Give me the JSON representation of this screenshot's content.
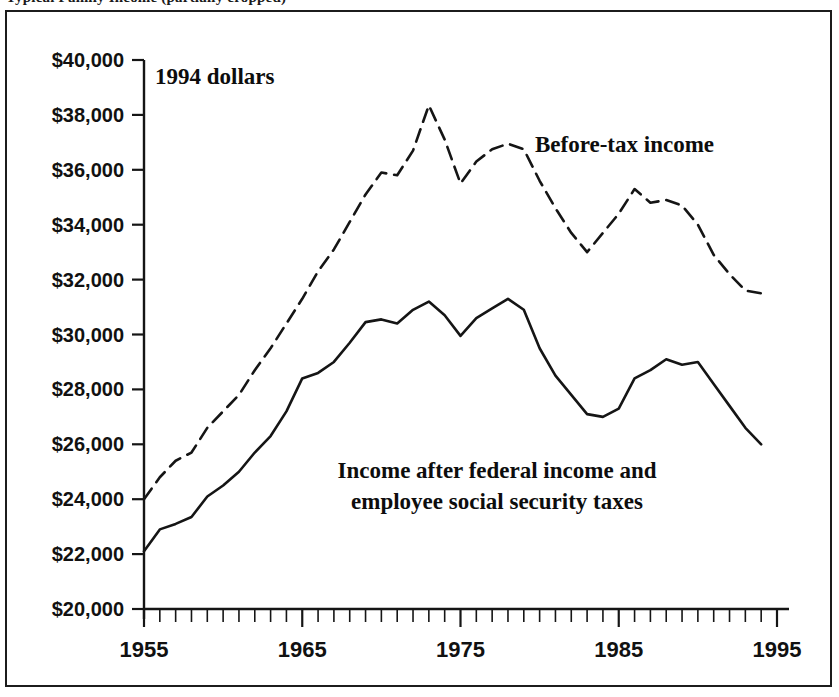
{
  "figure": {
    "title_sliver": "Typical Family Income (partially cropped)",
    "frame_border_color": "#1c1c1c",
    "background_color": "#ffffff"
  },
  "annotations": {
    "units_note": "1994 dollars",
    "before_tax_label": "Before-tax income",
    "after_tax_label_line1": "Income after federal income and",
    "after_tax_label_line2": "employee social security taxes"
  },
  "chart_data": {
    "type": "line",
    "title": "",
    "xlabel": "",
    "ylabel": "",
    "xlim": [
      1955,
      1995
    ],
    "ylim": [
      20000,
      40000
    ],
    "ytick_step": 2000,
    "xtick_step": 1,
    "grid": false,
    "legend_position": "inline-annotation",
    "ytick_labels": [
      "$40,000",
      "$38,000",
      "$36,000",
      "$34,000",
      "$32,000",
      "$30,000",
      "$28,000",
      "$26,000",
      "$24,000",
      "$22,000",
      "$20,000"
    ],
    "ytick_values": [
      40000,
      38000,
      36000,
      34000,
      32000,
      30000,
      28000,
      26000,
      24000,
      22000,
      20000
    ],
    "xtick_labels": [
      "1955",
      "1965",
      "1975",
      "1985",
      "1995"
    ],
    "xtick_values": [
      1955,
      1965,
      1975,
      1985,
      1995
    ],
    "x": [
      1955,
      1956,
      1957,
      1958,
      1959,
      1960,
      1961,
      1962,
      1963,
      1964,
      1965,
      1966,
      1967,
      1968,
      1969,
      1970,
      1971,
      1972,
      1973,
      1974,
      1975,
      1976,
      1977,
      1978,
      1979,
      1980,
      1981,
      1982,
      1983,
      1984,
      1985,
      1986,
      1987,
      1988,
      1989,
      1990,
      1991,
      1992,
      1993,
      1994
    ],
    "series": [
      {
        "name": "Before-tax income",
        "style": "dashed",
        "color": "#151515",
        "values": [
          24000,
          24800,
          25400,
          25700,
          26600,
          27200,
          27800,
          28700,
          29500,
          30400,
          31300,
          32300,
          33100,
          34100,
          35100,
          35900,
          35800,
          36700,
          38350,
          37100,
          35500,
          36300,
          36750,
          36950,
          36750,
          35600,
          34600,
          33700,
          33000,
          33700,
          34400,
          35300,
          34800,
          34900,
          34700,
          34000,
          32900,
          32200,
          31600,
          31500
        ]
      },
      {
        "name": "Income after federal income and employee social security taxes",
        "style": "solid",
        "color": "#151515",
        "values": [
          22100,
          22900,
          23100,
          23350,
          24100,
          24500,
          25000,
          25700,
          26300,
          27200,
          28400,
          28600,
          29000,
          29700,
          30450,
          30550,
          30400,
          30900,
          31200,
          30700,
          29950,
          30600,
          30950,
          31300,
          30900,
          29500,
          28500,
          27800,
          27100,
          27000,
          27300,
          28400,
          28700,
          29100,
          28900,
          29000,
          28200,
          27400,
          26600,
          26000
        ]
      }
    ]
  }
}
